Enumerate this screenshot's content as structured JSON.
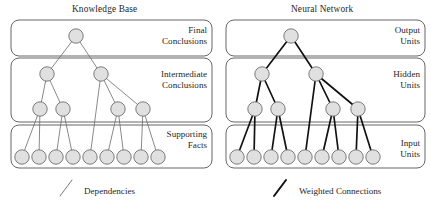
{
  "figure": {
    "background": "#ffffff",
    "node_fill": "#e0e0e0",
    "node_stroke": "#6e6e6e",
    "box_stroke": "#555555",
    "edge_color_left": "#6b6b6b",
    "edge_color_right": "#121212"
  },
  "panels": [
    {
      "id": "knowledge-base",
      "title": "Knowledge Base",
      "title_x": 72,
      "title_y": 4,
      "edge_color": "#6b6b6b",
      "edge_width": 0.8,
      "legend": {
        "label": "Dependencies",
        "label_x": 84,
        "label_y": 186,
        "mark": {
          "x1": 60,
          "y1": 196,
          "x2": 72,
          "y2": 180,
          "width": 0.9
        }
      },
      "boxes": [
        {
          "name": "final-conclusions-box",
          "x": 11,
          "y": 20,
          "w": 201,
          "h": 36,
          "rx": 8,
          "label": "Final\nConclusions",
          "label_right": 207,
          "label_top": 25
        },
        {
          "name": "intermediate-conclusions-box",
          "x": 11,
          "y": 58,
          "w": 201,
          "h": 64,
          "rx": 8,
          "label": "Intermediate\nConclusions",
          "label_right": 207,
          "label_top": 69
        },
        {
          "name": "supporting-facts-box",
          "x": 11,
          "y": 125,
          "w": 201,
          "h": 43,
          "rx": 8,
          "label": "Supporting\nFacts",
          "label_right": 207,
          "label_top": 129
        }
      ],
      "rows": [
        {
          "name": "final-conclusions",
          "y": 36,
          "r": 7.2,
          "x": [
            76
          ]
        },
        {
          "name": "intermediate-conclusions",
          "y": 74,
          "r": 7.2,
          "x": [
            47,
            101
          ]
        },
        {
          "name": "intermediate-lower",
          "y": 109,
          "r": 7.2,
          "x": [
            40,
            63,
            118,
            143
          ]
        },
        {
          "name": "supporting-facts",
          "y": 157,
          "r": 7.2,
          "x": [
            22,
            39,
            56,
            73,
            90,
            107,
            124,
            141,
            158
          ]
        }
      ],
      "edges": [
        [
          0,
          0,
          1,
          0
        ],
        [
          0,
          0,
          1,
          1
        ],
        [
          1,
          0,
          2,
          0
        ],
        [
          1,
          0,
          2,
          1
        ],
        [
          1,
          1,
          2,
          2
        ],
        [
          1,
          1,
          2,
          3
        ],
        [
          1,
          1,
          3,
          4
        ],
        [
          2,
          0,
          3,
          0
        ],
        [
          2,
          0,
          3,
          1
        ],
        [
          2,
          1,
          3,
          2
        ],
        [
          2,
          1,
          3,
          3
        ],
        [
          2,
          2,
          3,
          5
        ],
        [
          2,
          2,
          3,
          6
        ],
        [
          2,
          3,
          3,
          7
        ],
        [
          2,
          3,
          3,
          8
        ]
      ]
    },
    {
      "id": "neural-network",
      "title": "Neural Network",
      "title_x": 291,
      "title_y": 4,
      "edge_color": "#121212",
      "edge_width": 1.7,
      "legend": {
        "label": "Weighted Connections",
        "label_x": 299,
        "label_y": 186,
        "mark": {
          "x1": 274,
          "y1": 196,
          "x2": 286,
          "y2": 180,
          "width": 2.0
        }
      },
      "boxes": [
        {
          "name": "output-units-box",
          "x": 226,
          "y": 20,
          "w": 199,
          "h": 36,
          "rx": 8,
          "label": "Output\nUnits",
          "label_right": 420,
          "label_top": 25
        },
        {
          "name": "hidden-units-box",
          "x": 226,
          "y": 58,
          "w": 199,
          "h": 64,
          "rx": 8,
          "label": "Hidden\nUnits",
          "label_right": 420,
          "label_top": 69
        },
        {
          "name": "input-units-box",
          "x": 226,
          "y": 125,
          "w": 199,
          "h": 43,
          "rx": 8,
          "label": "Input\nUnits",
          "label_right": 420,
          "label_top": 138
        }
      ],
      "rows": [
        {
          "name": "output-units",
          "y": 36,
          "r": 7.2,
          "x": [
            291
          ]
        },
        {
          "name": "hidden-upper",
          "y": 74,
          "r": 7.2,
          "x": [
            262,
            316
          ]
        },
        {
          "name": "hidden-lower",
          "y": 109,
          "r": 7.2,
          "x": [
            255,
            278,
            333,
            358
          ]
        },
        {
          "name": "input-units",
          "y": 157,
          "r": 7.2,
          "x": [
            237,
            254,
            271,
            288,
            305,
            322,
            339,
            356,
            373
          ]
        }
      ],
      "edges": [
        [
          0,
          0,
          1,
          0
        ],
        [
          0,
          0,
          1,
          1
        ],
        [
          1,
          0,
          2,
          0
        ],
        [
          1,
          0,
          2,
          1
        ],
        [
          1,
          1,
          2,
          2
        ],
        [
          1,
          1,
          2,
          3
        ],
        [
          1,
          1,
          3,
          4
        ],
        [
          2,
          0,
          3,
          0
        ],
        [
          2,
          0,
          3,
          1
        ],
        [
          2,
          1,
          3,
          2
        ],
        [
          2,
          1,
          3,
          3
        ],
        [
          2,
          2,
          3,
          5
        ],
        [
          2,
          2,
          3,
          6
        ],
        [
          2,
          3,
          3,
          7
        ],
        [
          2,
          3,
          3,
          8
        ]
      ]
    }
  ]
}
